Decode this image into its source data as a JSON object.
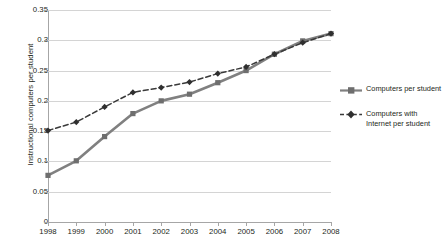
{
  "chart_data": {
    "type": "line",
    "title": "",
    "xlabel": "",
    "ylabel": "Instructional computers per student",
    "x": [
      1998,
      1999,
      2000,
      2001,
      2002,
      2003,
      2004,
      2005,
      2006,
      2007,
      2008
    ],
    "categories": [
      "1998",
      "1999",
      "2000",
      "2001",
      "2002",
      "2003",
      "2004",
      "2005",
      "2006",
      "2007",
      "2008"
    ],
    "ylim": [
      0,
      0.35
    ],
    "yticks": [
      0,
      0.05,
      0.1,
      0.15,
      0.2,
      0.25,
      0.3,
      0.35
    ],
    "ytick_labels": [
      "0",
      "0.05",
      "0.1",
      "0.15",
      "0.2",
      "0.25",
      "0.3",
      "0.35"
    ],
    "grid": true,
    "legend_position": "right",
    "series": [
      {
        "name": "Computers per student",
        "values": [
          0.077,
          0.101,
          0.141,
          0.179,
          0.2,
          0.211,
          0.23,
          0.25,
          0.277,
          0.299,
          0.311
        ],
        "color": "#808080",
        "style": "solid",
        "marker": "square"
      },
      {
        "name": "Computers with Internet per student",
        "values": [
          0.151,
          0.165,
          0.19,
          0.214,
          0.222,
          0.231,
          0.245,
          0.256,
          0.277,
          0.296,
          0.311
        ],
        "color": "#3a3a3a",
        "style": "dashed",
        "marker": "diamond"
      }
    ]
  },
  "legend": {
    "entries": [
      {
        "label": "Computers per student",
        "swatch_name": "legend-swatch-solid-square"
      },
      {
        "label": "Computers with Internet per student",
        "swatch_name": "legend-swatch-dashed-diamond"
      }
    ]
  },
  "colors": {
    "series1": "#808080",
    "series2": "#3a3a3a",
    "gridline": "#d4d4d4",
    "axis": "#a6a6a6",
    "text": "#231f20",
    "background": "#ffffff"
  }
}
